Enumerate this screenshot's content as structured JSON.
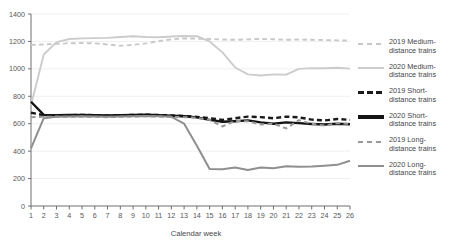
{
  "chart_data": {
    "type": "line",
    "title": "",
    "xlabel": "Calendar week",
    "ylabel": "",
    "xlim": [
      1,
      26
    ],
    "ylim": [
      0,
      1400
    ],
    "grid": true,
    "grid_axis": "y",
    "legend_position": "right",
    "x": [
      1,
      2,
      3,
      4,
      5,
      6,
      7,
      8,
      9,
      10,
      11,
      12,
      13,
      14,
      15,
      16,
      17,
      18,
      19,
      20,
      21,
      22,
      23,
      24,
      25,
      26
    ],
    "xtick_labels": [
      "1",
      "2",
      "3",
      "4",
      "5",
      "6",
      "7",
      "8",
      "9",
      "10",
      "11",
      "12",
      "13",
      "14",
      "15",
      "16",
      "17",
      "18",
      "19",
      "20",
      "21",
      "22",
      "23",
      "24",
      "25",
      "26"
    ],
    "ytick_labels": [
      "0",
      "200",
      "400",
      "600",
      "800",
      "1000",
      "1200",
      "1400"
    ],
    "yticks": [
      0,
      200,
      400,
      600,
      800,
      1000,
      1200,
      1400
    ],
    "series": [
      {
        "name": "2019 Medium-distance trains",
        "key": "medium_2019",
        "style": "dashed",
        "color": "#c8c8c8",
        "width": 1.9,
        "values": [
          1175,
          1178,
          1182,
          1186,
          1188,
          1186,
          1178,
          1168,
          1175,
          1186,
          1202,
          1215,
          1222,
          1220,
          1218,
          1214,
          1212,
          1215,
          1218,
          1216,
          1212,
          1214,
          1212,
          1210,
          1208,
          1206
        ]
      },
      {
        "name": "2020 Medium-distance trains",
        "key": "medium_2020",
        "style": "solid",
        "color": "#cccccc",
        "width": 1.9,
        "values": [
          735,
          1105,
          1195,
          1218,
          1222,
          1224,
          1226,
          1232,
          1238,
          1232,
          1230,
          1236,
          1240,
          1238,
          1200,
          1120,
          1010,
          960,
          952,
          960,
          958,
          1000,
          1005,
          1004,
          1008,
          1002
        ]
      },
      {
        "name": "2019 Short-distance trains",
        "key": "short_2019",
        "style": "dashed",
        "color": "#1a1a1a",
        "width": 2.4,
        "values": [
          680,
          662,
          660,
          662,
          664,
          662,
          660,
          662,
          664,
          666,
          664,
          660,
          656,
          650,
          640,
          628,
          640,
          652,
          648,
          640,
          652,
          646,
          630,
          624,
          634,
          628
        ]
      },
      {
        "name": "2020 Short-distance trains",
        "key": "short_2020",
        "style": "solid",
        "color": "#141414",
        "width": 2.4,
        "values": [
          760,
          664,
          662,
          663,
          664,
          662,
          660,
          662,
          664,
          666,
          662,
          658,
          654,
          646,
          628,
          614,
          618,
          624,
          610,
          600,
          610,
          604,
          598,
          594,
          600,
          596
        ]
      },
      {
        "name": "2019 Long-distance trains",
        "key": "long_2019",
        "style": "dashed",
        "color": "#9a9a9a",
        "width": 2.0,
        "values": [
          648,
          650,
          652,
          650,
          652,
          650,
          648,
          650,
          652,
          654,
          652,
          650,
          648,
          642,
          628,
          580,
          620,
          618,
          594,
          600,
          566,
          626,
          600,
          586,
          604,
          598
        ]
      },
      {
        "name": "2020 Long-distance trains",
        "key": "long_2020",
        "style": "solid",
        "color": "#8f8f8f",
        "width": 2.0,
        "values": [
          420,
          640,
          650,
          652,
          654,
          652,
          650,
          652,
          654,
          656,
          654,
          650,
          600,
          440,
          270,
          268,
          280,
          262,
          280,
          276,
          290,
          286,
          288,
          294,
          300,
          330
        ]
      }
    ]
  },
  "legend": {
    "items": [
      {
        "label": "2019 Medium-\ndistance trains",
        "style": "dashed",
        "color": "#c8c8c8",
        "width": 2
      },
      {
        "label": "2020 Medium-\ndistance trains",
        "style": "solid",
        "color": "#cccccc",
        "width": 2
      },
      {
        "label": "2019 Short-\ndistance trains",
        "style": "dashed",
        "color": "#1a1a1a",
        "width": 3
      },
      {
        "label": "2020 Short-\ndistance trains",
        "style": "solid",
        "color": "#141414",
        "width": 3.4
      },
      {
        "label": "2019 Long-\ndistance trains",
        "style": "dashed",
        "color": "#9a9a9a",
        "width": 2
      },
      {
        "label": "2020 Long-\ndistance trains",
        "style": "solid",
        "color": "#8f8f8f",
        "width": 2
      }
    ]
  },
  "axes": {
    "x_title": "Calendar week"
  }
}
